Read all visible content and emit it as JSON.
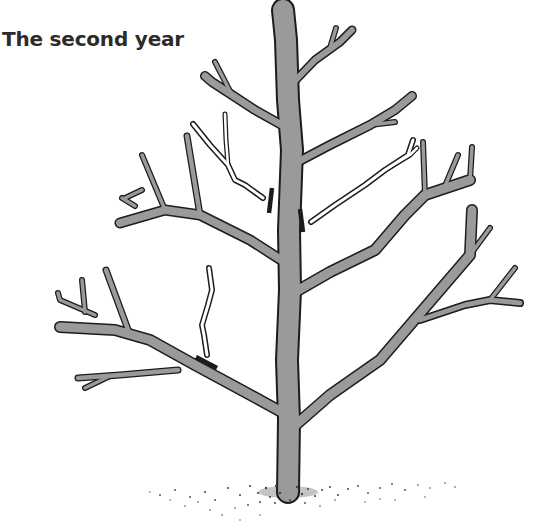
{
  "figure": {
    "title": "The second year",
    "illustration": "pruning-diagram-young-tree",
    "colors": {
      "background": "#ffffff",
      "bark_fill": "#9a9a9a",
      "outline": "#1c1c1c",
      "cut_mark": "#1c1c1c",
      "removed_branch_fill": "#ffffff",
      "title_text": "#2b2b2b"
    },
    "legend_semantics": {
      "grey_branches": "retained framework",
      "white_branches": "branches to be removed",
      "black_bars": "pruning cut positions"
    }
  }
}
